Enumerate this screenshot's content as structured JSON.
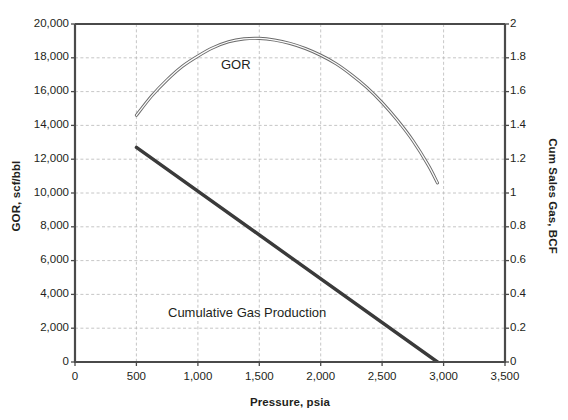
{
  "chart_data": {
    "type": "line",
    "title": "",
    "xlabel": "Pressure, psia",
    "ylabel": "GOR, scf/bbl",
    "ylabel_secondary": "Cum Sales Gas, BCF",
    "xlim": [
      0,
      3500
    ],
    "ylim": [
      0,
      20000
    ],
    "ylim_secondary": [
      0,
      2
    ],
    "grid": true,
    "legend_position": "inline-annotations",
    "xticks": [
      0,
      500,
      1000,
      1500,
      2000,
      2500,
      3000,
      3500
    ],
    "xticklabels": [
      "0",
      "500",
      "1,000",
      "1,500",
      "2,000",
      "2,500",
      "3,000",
      "3,500"
    ],
    "yticks": [
      0,
      2000,
      4000,
      6000,
      8000,
      10000,
      12000,
      14000,
      16000,
      18000,
      20000
    ],
    "yticklabels": [
      "0",
      "2,000",
      "4,000",
      "6,000",
      "8,000",
      "10,000",
      "12,000",
      "14,000",
      "16,000",
      "18,000",
      "20,000"
    ],
    "yticks_secondary": [
      0,
      0.2,
      0.4,
      0.6,
      0.8,
      1,
      1.2,
      1.4,
      1.6,
      1.8,
      2
    ],
    "yticklabels_secondary": [
      "0",
      "0.2",
      "0.4",
      "0.6",
      "0.8",
      "1",
      "1.2",
      "1.4",
      "1.6",
      "1.8",
      "2"
    ],
    "series": [
      {
        "name": "GOR",
        "axis": "left",
        "annotation": "GOR",
        "color": "#6b6b6b",
        "style": "double-stroke",
        "x": [
          500,
          625,
          750,
          875,
          1000,
          1125,
          1250,
          1375,
          1500,
          1625,
          1750,
          1875,
          2000,
          2125,
          2250,
          2375,
          2500,
          2625,
          2750,
          2875,
          2950
        ],
        "y": [
          14600,
          15750,
          16700,
          17500,
          18100,
          18600,
          18950,
          19120,
          19150,
          19050,
          18850,
          18550,
          18150,
          17650,
          17000,
          16250,
          15350,
          14300,
          13100,
          11650,
          10600
        ]
      },
      {
        "name": "Cumulative Gas Production",
        "axis": "right",
        "annotation": "Cumulative Gas Production",
        "color": "#3a3a3a",
        "style": "solid-thick",
        "x": [
          500,
          2950
        ],
        "y": [
          1.27,
          0.0
        ],
        "y_left_equivalent": [
          12700,
          0
        ]
      }
    ]
  },
  "annotations": {
    "gor": "GOR",
    "cumulative": "Cumulative Gas Production"
  },
  "colors": {
    "axis": "#4a4a4a",
    "grid": "#b8b8b8",
    "gor_line": "#6b6b6b",
    "cum_line": "#3a3a3a",
    "text": "#231f20",
    "background": "#ffffff"
  }
}
